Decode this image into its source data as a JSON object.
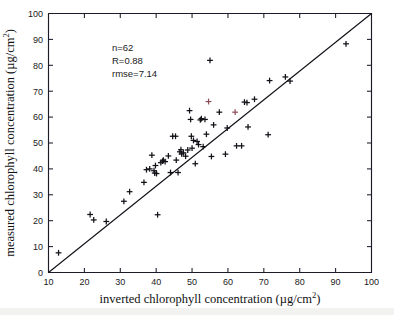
{
  "figure": {
    "background_color": "#ffffff",
    "marker_color": "#121218",
    "marker_color_alt": "#8d4a55",
    "axis_color": "#1b1b2a"
  },
  "annotations": {
    "n_label": "n=62",
    "r_label": "R=0.88",
    "rmse_label": "rmse=7.14"
  },
  "chart_data": {
    "type": "scatter",
    "title": "",
    "xlabel": "inverted chlorophyll concentration (µg/cm²)",
    "ylabel": "measured chlorophyll concentration (µg/cm²)",
    "xlim": [
      10,
      100
    ],
    "ylim": [
      0,
      100
    ],
    "xticks": [
      10,
      20,
      30,
      40,
      50,
      60,
      70,
      80,
      90,
      100
    ],
    "yticks": [
      0,
      10,
      20,
      30,
      40,
      50,
      60,
      70,
      80,
      90,
      100
    ],
    "grid": false,
    "legend": "none",
    "marker_style": "plus",
    "reference_line": {
      "name": "1:1 identity line",
      "x": [
        10,
        100
      ],
      "y": [
        0,
        100
      ]
    },
    "statistics": {
      "n": 62,
      "R": 0.88,
      "rmse": 7.14
    },
    "points": [
      {
        "x": 12.8,
        "y": 7.6,
        "color": "#121218"
      },
      {
        "x": 21.6,
        "y": 22.4,
        "color": "#121218"
      },
      {
        "x": 22.6,
        "y": 20.3,
        "color": "#121218"
      },
      {
        "x": 26.1,
        "y": 19.7,
        "color": "#121218"
      },
      {
        "x": 31.0,
        "y": 27.5,
        "color": "#121218"
      },
      {
        "x": 32.6,
        "y": 31.2,
        "color": "#121218"
      },
      {
        "x": 36.6,
        "y": 34.8,
        "color": "#121218"
      },
      {
        "x": 37.3,
        "y": 39.7,
        "color": "#121218"
      },
      {
        "x": 38.2,
        "y": 40.0,
        "color": "#121218"
      },
      {
        "x": 38.8,
        "y": 45.3,
        "color": "#121218"
      },
      {
        "x": 39.4,
        "y": 39.3,
        "color": "#121218"
      },
      {
        "x": 39.6,
        "y": 38.4,
        "color": "#121218"
      },
      {
        "x": 39.8,
        "y": 41.3,
        "color": "#121218"
      },
      {
        "x": 40.1,
        "y": 38.2,
        "color": "#121218"
      },
      {
        "x": 40.4,
        "y": 22.3,
        "color": "#121218"
      },
      {
        "x": 41.3,
        "y": 42.4,
        "color": "#121218"
      },
      {
        "x": 41.8,
        "y": 43.0,
        "color": "#121218"
      },
      {
        "x": 42.0,
        "y": 43.4,
        "color": "#121218"
      },
      {
        "x": 42.5,
        "y": 42.8,
        "color": "#121218"
      },
      {
        "x": 43.4,
        "y": 45.0,
        "color": "#121218"
      },
      {
        "x": 44.0,
        "y": 38.6,
        "color": "#121218"
      },
      {
        "x": 44.6,
        "y": 52.6,
        "color": "#121218"
      },
      {
        "x": 45.4,
        "y": 52.6,
        "color": "#121218"
      },
      {
        "x": 45.6,
        "y": 43.4,
        "color": "#121218"
      },
      {
        "x": 46.1,
        "y": 38.6,
        "color": "#121218"
      },
      {
        "x": 46.6,
        "y": 46.6,
        "color": "#121218"
      },
      {
        "x": 46.9,
        "y": 47.4,
        "color": "#121218"
      },
      {
        "x": 47.1,
        "y": 45.8,
        "color": "#121218"
      },
      {
        "x": 47.6,
        "y": 46.2,
        "color": "#121218"
      },
      {
        "x": 48.2,
        "y": 44.9,
        "color": "#121218"
      },
      {
        "x": 48.8,
        "y": 47.3,
        "color": "#121218"
      },
      {
        "x": 49.3,
        "y": 62.5,
        "color": "#121218"
      },
      {
        "x": 49.6,
        "y": 59.1,
        "color": "#121218"
      },
      {
        "x": 49.8,
        "y": 52.6,
        "color": "#121218"
      },
      {
        "x": 50.0,
        "y": 48.0,
        "color": "#121218"
      },
      {
        "x": 50.4,
        "y": 51.0,
        "color": "#121218"
      },
      {
        "x": 50.9,
        "y": 42.0,
        "color": "#121218"
      },
      {
        "x": 51.4,
        "y": 50.6,
        "color": "#121218"
      },
      {
        "x": 51.8,
        "y": 49.4,
        "color": "#121218"
      },
      {
        "x": 52.3,
        "y": 58.9,
        "color": "#121218"
      },
      {
        "x": 52.6,
        "y": 59.4,
        "color": "#121218"
      },
      {
        "x": 53.1,
        "y": 48.6,
        "color": "#121218"
      },
      {
        "x": 53.6,
        "y": 59.1,
        "color": "#121218"
      },
      {
        "x": 54.0,
        "y": 53.4,
        "color": "#121218"
      },
      {
        "x": 54.6,
        "y": 66.0,
        "color": "#8d4a55"
      },
      {
        "x": 55.0,
        "y": 81.9,
        "color": "#121218"
      },
      {
        "x": 55.4,
        "y": 44.8,
        "color": "#121218"
      },
      {
        "x": 56.0,
        "y": 57.0,
        "color": "#121218"
      },
      {
        "x": 57.6,
        "y": 61.9,
        "color": "#121218"
      },
      {
        "x": 59.3,
        "y": 45.7,
        "color": "#121218"
      },
      {
        "x": 59.8,
        "y": 55.8,
        "color": "#121218"
      },
      {
        "x": 62.0,
        "y": 61.9,
        "color": "#8d4a55"
      },
      {
        "x": 62.4,
        "y": 48.9,
        "color": "#121218"
      },
      {
        "x": 63.8,
        "y": 48.9,
        "color": "#121218"
      },
      {
        "x": 64.6,
        "y": 65.8,
        "color": "#121218"
      },
      {
        "x": 65.3,
        "y": 65.6,
        "color": "#121218"
      },
      {
        "x": 65.6,
        "y": 56.2,
        "color": "#121218"
      },
      {
        "x": 67.4,
        "y": 66.9,
        "color": "#121218"
      },
      {
        "x": 71.2,
        "y": 53.2,
        "color": "#121218"
      },
      {
        "x": 71.6,
        "y": 74.1,
        "color": "#121218"
      },
      {
        "x": 76.0,
        "y": 75.5,
        "color": "#121218"
      },
      {
        "x": 77.3,
        "y": 73.9,
        "color": "#121218"
      },
      {
        "x": 92.9,
        "y": 88.3,
        "color": "#121218"
      }
    ]
  }
}
